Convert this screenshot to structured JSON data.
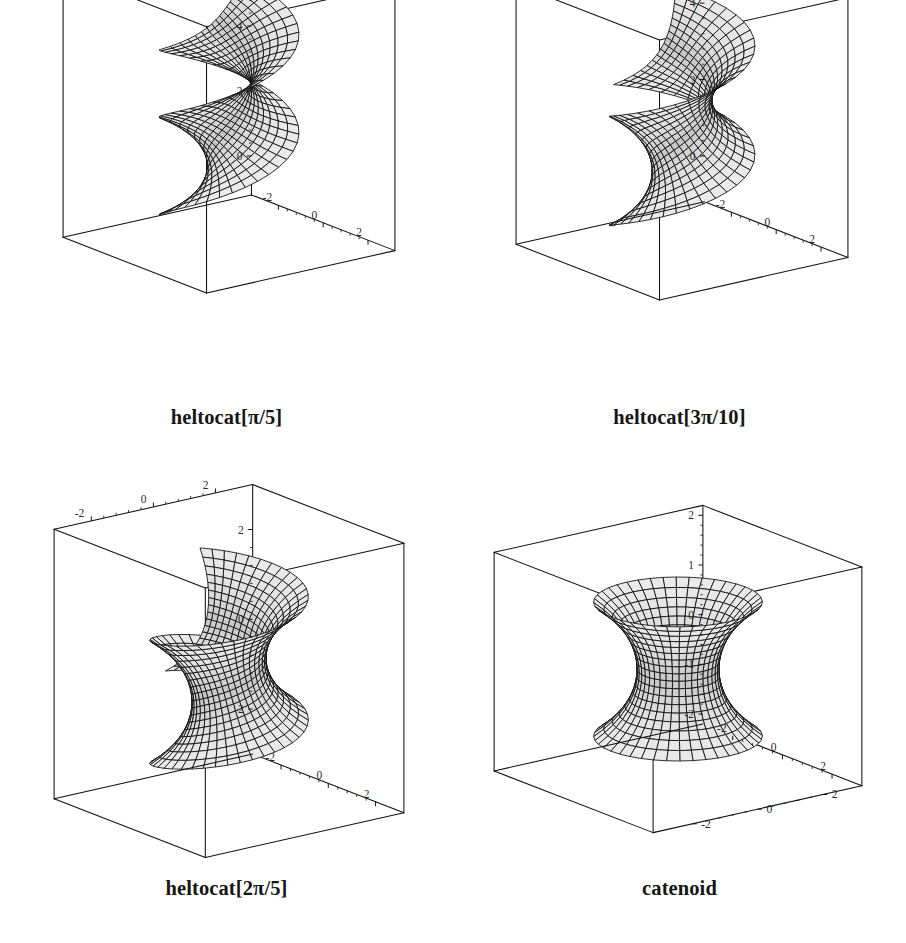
{
  "figure": {
    "background_color": "#ffffff",
    "line_color": "#111111",
    "surface_fill_light": "#c8c8c8",
    "surface_fill_dark": "#9a9a9a",
    "mesh_color": "#0d0d0d",
    "tick_label_color": "#2b2b2b",
    "rows": 2,
    "columns": 2
  },
  "panels": [
    {
      "id": "panel-heltocat-pi-5",
      "caption": "heltocat[π/5]",
      "caption_parts": {
        "name": "heltocat",
        "open": "[",
        "coeff": "",
        "pi": "π",
        "slash": "/",
        "denom": "5",
        "close": "]"
      },
      "surface": "helicoid-catenoid deformation",
      "deformation_angle": "π/5",
      "axes": {
        "top_axis": {
          "name": "x-axis-top",
          "ticks": [
            "-2",
            "0",
            "2"
          ],
          "minor_ticks": 4
        },
        "left_axis": {
          "name": "z-axis-left",
          "ticks": [
            "6",
            "4",
            "2",
            "0"
          ],
          "minor_ticks": 4
        },
        "bottom_axis": {
          "name": "y-axis-bottom",
          "ticks": [
            "-2",
            "0",
            "2"
          ],
          "minor_ticks": 4
        }
      }
    },
    {
      "id": "panel-heltocat-3pi-10",
      "caption": "heltocat[3π/10]",
      "caption_parts": {
        "name": "heltocat",
        "open": "[",
        "coeff": "3",
        "pi": "π",
        "slash": "/",
        "denom": "10",
        "close": "]"
      },
      "surface": "helicoid-catenoid deformation",
      "deformation_angle": "3π/10",
      "axes": {
        "top_axis": {
          "name": "x-axis-top",
          "ticks": [
            "-2",
            "0",
            "2"
          ],
          "minor_ticks": 4
        },
        "left_axis": {
          "name": "z-axis-left",
          "ticks": [
            "4",
            "2",
            "0"
          ],
          "minor_ticks": 4
        },
        "bottom_axis": {
          "name": "y-axis-bottom",
          "ticks": [
            "-2",
            "0",
            "2"
          ],
          "minor_ticks": 4
        }
      }
    },
    {
      "id": "panel-heltocat-2pi-5",
      "caption": "heltocat[2π/5]",
      "caption_parts": {
        "name": "heltocat",
        "open": "[",
        "coeff": "2",
        "pi": "π",
        "slash": "/",
        "denom": "5",
        "close": "]"
      },
      "surface": "helicoid-catenoid deformation",
      "deformation_angle": "2π/5",
      "axes": {
        "top_axis": {
          "name": "x-axis-top",
          "ticks": [
            "-2",
            "0",
            "2"
          ],
          "minor_ticks": 4
        },
        "left_axis": {
          "name": "z-axis-left",
          "ticks": [
            "2",
            "0",
            "-2"
          ],
          "minor_ticks": 4
        },
        "bottom_axis": {
          "name": "y-axis-bottom",
          "ticks": [
            "-2",
            "0",
            "2"
          ],
          "minor_ticks": 4
        }
      }
    },
    {
      "id": "panel-catenoid",
      "caption": "catenoid",
      "caption_parts": {
        "name": "catenoid",
        "open": "",
        "coeff": "",
        "pi": "",
        "slash": "",
        "denom": "",
        "close": ""
      },
      "surface": "catenoid",
      "deformation_angle": "π/2",
      "axes": {
        "top_axis": {
          "name": "x-axis-top",
          "ticks": [],
          "minor_ticks": 0
        },
        "left_axis": {
          "name": "z-axis-left",
          "ticks": [
            "2",
            "1",
            "0",
            "-1",
            "-2"
          ],
          "minor_ticks": 4
        },
        "bottom_axis": {
          "name": "y-axis-bottom",
          "ticks": [
            "-2",
            "0",
            "2"
          ],
          "minor_ticks": 4
        },
        "right_axis": {
          "name": "x-axis-right",
          "ticks": [
            "-2",
            "0",
            "2"
          ],
          "minor_ticks": 4
        }
      }
    }
  ],
  "chart_data": {
    "type": "scatter",
    "title": "",
    "subtitle": "",
    "xlabel": "",
    "ylabel": "",
    "plots": [
      {
        "name": "heltocat[π/5]",
        "xlim": [
          -3,
          3
        ],
        "ylim": [
          -3,
          3
        ],
        "zlim": [
          -1,
          7
        ],
        "z_ticks": [
          0,
          2,
          4,
          6
        ],
        "x_ticks": [
          -2,
          0,
          2
        ],
        "y_ticks": [
          -2,
          0,
          2
        ],
        "grid": false
      },
      {
        "name": "heltocat[3π/10]",
        "xlim": [
          -3,
          3
        ],
        "ylim": [
          -3,
          3
        ],
        "zlim": [
          -1,
          5
        ],
        "z_ticks": [
          0,
          2,
          4
        ],
        "x_ticks": [
          -2,
          0,
          2
        ],
        "y_ticks": [
          -2,
          0,
          2
        ],
        "grid": false
      },
      {
        "name": "heltocat[2π/5]",
        "xlim": [
          -3,
          3
        ],
        "ylim": [
          -3,
          3
        ],
        "zlim": [
          -3,
          3
        ],
        "z_ticks": [
          -2,
          0,
          2
        ],
        "x_ticks": [
          -2,
          0,
          2
        ],
        "y_ticks": [
          -2,
          0,
          2
        ],
        "grid": false
      },
      {
        "name": "catenoid",
        "xlim": [
          -3,
          3
        ],
        "ylim": [
          -3,
          3
        ],
        "zlim": [
          -2,
          2
        ],
        "z_ticks": [
          -2,
          -1,
          0,
          1,
          2
        ],
        "x_ticks": [
          -2,
          0,
          2
        ],
        "y_ticks": [
          -2,
          0,
          2
        ],
        "grid": false
      }
    ],
    "legend": [],
    "legend_position": "none"
  }
}
